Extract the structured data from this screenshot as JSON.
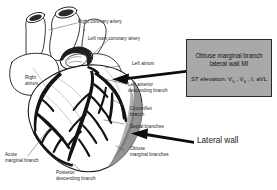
{
  "figure": {
    "type": "anatomical-diagram",
    "background_color": "#ffffff",
    "line_color": "#1a1a1a",
    "vessel_color": "#141414",
    "shaded_wall_color": "#8f8f8f",
    "callout_fill_color": "#a9a9a9",
    "callout_border_color": "#2b2b2b"
  },
  "callout": {
    "title": "Obtuse marginal branch\nlateral wall MI",
    "st_prefix": "ST elevation: V",
    "lead_1_sub": "5",
    "lead_sep_1": " , V",
    "lead_2_sub": "6",
    "lead_tail": " , I, aVL",
    "st_elevation_plain": "ST elevation: V5 , V6 , I, aVL",
    "leads": [
      "V5",
      "V6",
      "I",
      "aVL"
    ]
  },
  "labels": {
    "right_coronary_artery": "Right coronary artery",
    "left_main_coronary_artery": "Left main coronary artery",
    "left_atrium": "Left atrium",
    "left_anterior_descending_branch": "Left anterior\ndescending branch",
    "circumflex_branch": "Circumflex\nbranch",
    "septal_branches": "Septal branches",
    "obtuse_marginal_branches": "Obtuse\nmarginal branches",
    "right_atrium": "Right\natrium",
    "acute_marginal_branch": "Acute\nmarginal branch",
    "posterior_descending_branch": "Posterior\ndescending branch",
    "lateral_wall": "Lateral wall"
  }
}
